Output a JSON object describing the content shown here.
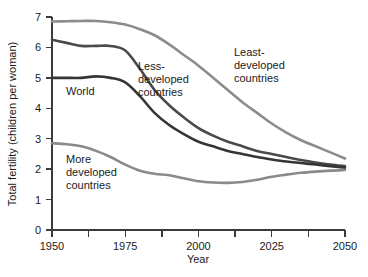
{
  "chart_data": {
    "type": "line",
    "title": "",
    "xlabel": "Year",
    "ylabel": "Total fertility (children per woman)",
    "xlim": [
      1950,
      2050
    ],
    "ylim": [
      0,
      7
    ],
    "xticks": [
      1950,
      1962.5,
      1975,
      1987.5,
      2000,
      2012.5,
      2025,
      2037.5,
      2050
    ],
    "xtick_labels": [
      "1950",
      "",
      "1975",
      "",
      "2000",
      "",
      "2025",
      "",
      "2050"
    ],
    "yticks": [
      0,
      1,
      2,
      3,
      4,
      5,
      6,
      7
    ],
    "ytick_labels": [
      "0",
      "1",
      "2",
      "3",
      "4",
      "5",
      "6",
      "7"
    ],
    "grid": false,
    "legend": "inline-annotations",
    "x": [
      1950,
      1955,
      1960,
      1965,
      1970,
      1975,
      1980,
      1985,
      1990,
      1995,
      2000,
      2005,
      2010,
      2015,
      2020,
      2025,
      2030,
      2035,
      2040,
      2045,
      2050
    ],
    "series": [
      {
        "name": "Least-developed countries",
        "color": "#8c8c8c",
        "values": [
          6.85,
          6.86,
          6.87,
          6.87,
          6.83,
          6.75,
          6.6,
          6.4,
          6.1,
          5.75,
          5.4,
          5.0,
          4.6,
          4.2,
          3.85,
          3.5,
          3.2,
          2.95,
          2.75,
          2.55,
          2.35
        ]
      },
      {
        "name": "Less-developed countries",
        "color": "#4a4a4a",
        "values": [
          6.25,
          6.15,
          6.05,
          6.05,
          6.05,
          5.9,
          5.3,
          4.6,
          4.1,
          3.7,
          3.35,
          3.1,
          2.9,
          2.75,
          2.6,
          2.5,
          2.4,
          2.3,
          2.22,
          2.15,
          2.1
        ]
      },
      {
        "name": "World",
        "color": "#353535",
        "values": [
          5.0,
          5.0,
          5.0,
          5.05,
          5.0,
          4.85,
          4.4,
          3.85,
          3.45,
          3.15,
          2.9,
          2.75,
          2.6,
          2.5,
          2.4,
          2.32,
          2.25,
          2.2,
          2.15,
          2.1,
          2.05
        ]
      },
      {
        "name": "More developed countries",
        "color": "#8a8a8a",
        "values": [
          2.85,
          2.82,
          2.75,
          2.6,
          2.4,
          2.15,
          1.95,
          1.85,
          1.8,
          1.7,
          1.6,
          1.56,
          1.55,
          1.58,
          1.65,
          1.75,
          1.82,
          1.88,
          1.92,
          1.95,
          1.97
        ]
      }
    ],
    "annotations": [
      {
        "name": "least-developed-label",
        "lines": [
          "Least-",
          "developed",
          "countries"
        ],
        "x_px": 234,
        "y_px": 56
      },
      {
        "name": "less-developed-label",
        "lines": [
          "Less-",
          "developed",
          "countries"
        ],
        "x_px": 138,
        "y_px": 70
      },
      {
        "name": "world-label",
        "lines": [
          "World"
        ],
        "x_px": 66,
        "y_px": 95
      },
      {
        "name": "more-developed-label",
        "lines": [
          "More",
          "developed",
          "countries"
        ],
        "x_px": 66,
        "y_px": 163
      }
    ]
  }
}
